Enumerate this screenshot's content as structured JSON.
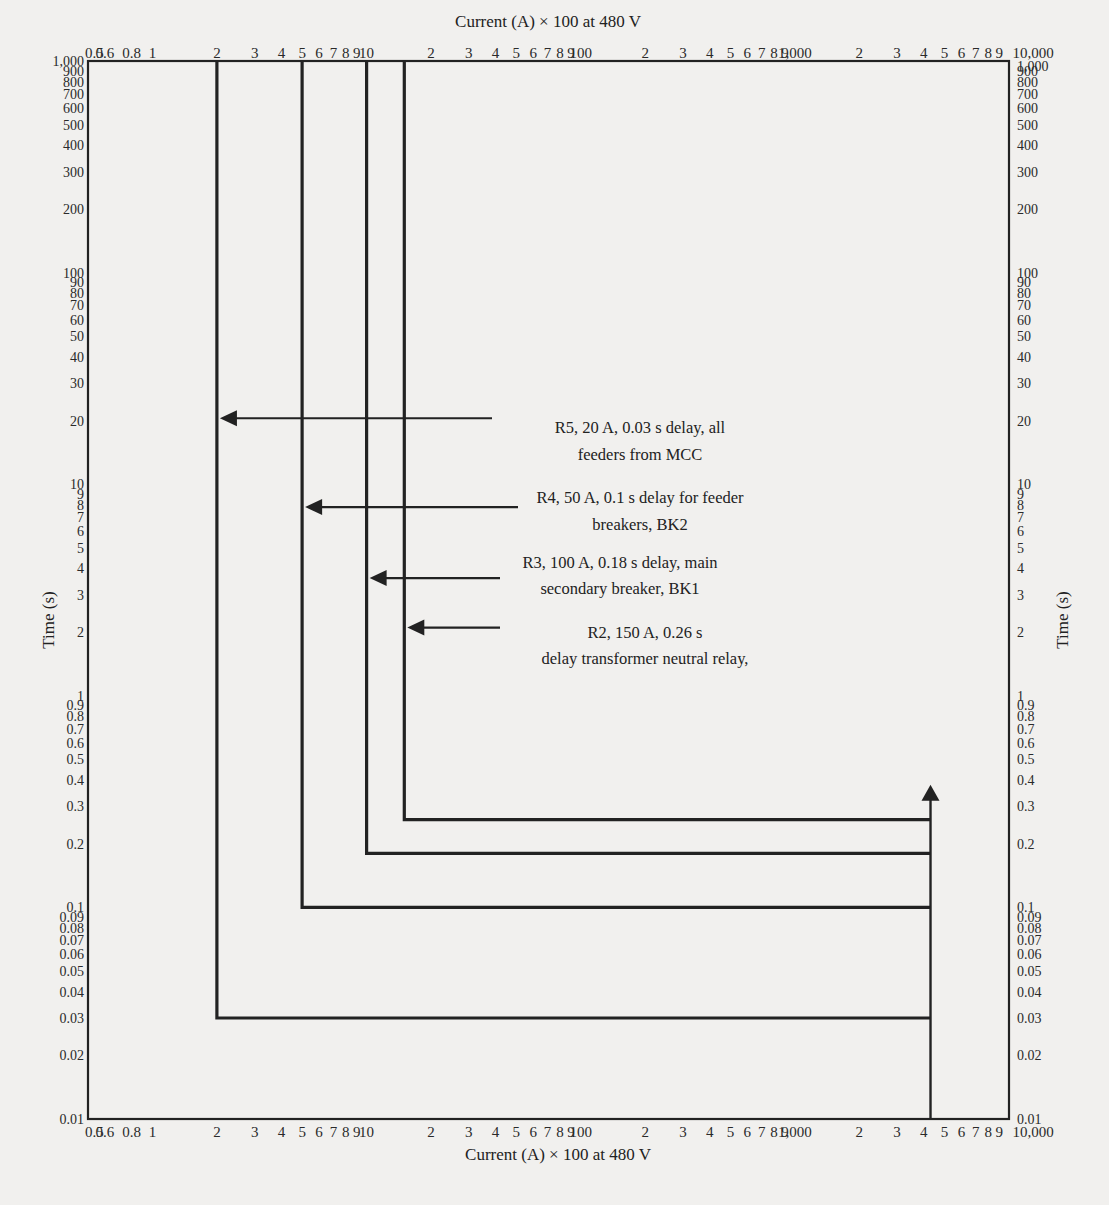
{
  "chart_data": {
    "type": "line",
    "title": "",
    "xlabel": "Current (A) × 100 at 480 V",
    "ylabel": "Time (s)",
    "xscale": "log",
    "yscale": "log",
    "xlim": [
      0.5,
      10000
    ],
    "ylim": [
      0.01,
      1000
    ],
    "grid": false,
    "x_tick_labels": [
      {
        "v": 0.5,
        "t": "0.5"
      },
      {
        "v": 0.6,
        "t": "0.6"
      },
      {
        "v": 0.8,
        "t": "0.8"
      },
      {
        "v": 1,
        "t": "1"
      },
      {
        "v": 2,
        "t": "2"
      },
      {
        "v": 3,
        "t": "3"
      },
      {
        "v": 4,
        "t": "4"
      },
      {
        "v": 5,
        "t": "5"
      },
      {
        "v": 6,
        "t": "6"
      },
      {
        "v": 7,
        "t": "7"
      },
      {
        "v": 8,
        "t": "8"
      },
      {
        "v": 9,
        "t": "9"
      },
      {
        "v": 10,
        "t": "10"
      },
      {
        "v": 20,
        "t": "2"
      },
      {
        "v": 30,
        "t": "3"
      },
      {
        "v": 40,
        "t": "4"
      },
      {
        "v": 50,
        "t": "5"
      },
      {
        "v": 60,
        "t": "6"
      },
      {
        "v": 70,
        "t": "7"
      },
      {
        "v": 80,
        "t": "8"
      },
      {
        "v": 90,
        "t": "9"
      },
      {
        "v": 100,
        "t": "100"
      },
      {
        "v": 200,
        "t": "2"
      },
      {
        "v": 300,
        "t": "3"
      },
      {
        "v": 400,
        "t": "4"
      },
      {
        "v": 500,
        "t": "5"
      },
      {
        "v": 600,
        "t": "6"
      },
      {
        "v": 700,
        "t": "7"
      },
      {
        "v": 800,
        "t": "8"
      },
      {
        "v": 900,
        "t": "9"
      },
      {
        "v": 1000,
        "t": "1,000"
      },
      {
        "v": 2000,
        "t": "2"
      },
      {
        "v": 3000,
        "t": "3"
      },
      {
        "v": 4000,
        "t": "4"
      },
      {
        "v": 5000,
        "t": "5"
      },
      {
        "v": 6000,
        "t": "6"
      },
      {
        "v": 7000,
        "t": "7"
      },
      {
        "v": 8000,
        "t": "8"
      },
      {
        "v": 9000,
        "t": "9"
      },
      {
        "v": 10000,
        "t": "10,000"
      }
    ],
    "y_tick_labels": [
      {
        "v": 1000,
        "t": "1,000"
      },
      {
        "v": 900,
        "t": "900"
      },
      {
        "v": 800,
        "t": "800"
      },
      {
        "v": 700,
        "t": "700"
      },
      {
        "v": 600,
        "t": "600"
      },
      {
        "v": 500,
        "t": "500"
      },
      {
        "v": 400,
        "t": "400"
      },
      {
        "v": 300,
        "t": "300"
      },
      {
        "v": 200,
        "t": "200"
      },
      {
        "v": 100,
        "t": "100"
      },
      {
        "v": 90,
        "t": "90"
      },
      {
        "v": 80,
        "t": "80"
      },
      {
        "v": 70,
        "t": "70"
      },
      {
        "v": 60,
        "t": "60"
      },
      {
        "v": 50,
        "t": "50"
      },
      {
        "v": 40,
        "t": "40"
      },
      {
        "v": 30,
        "t": "30"
      },
      {
        "v": 20,
        "t": "20"
      },
      {
        "v": 10,
        "t": "10"
      },
      {
        "v": 9,
        "t": "9"
      },
      {
        "v": 8,
        "t": "8"
      },
      {
        "v": 7,
        "t": "7"
      },
      {
        "v": 6,
        "t": "6"
      },
      {
        "v": 5,
        "t": "5"
      },
      {
        "v": 4,
        "t": "4"
      },
      {
        "v": 3,
        "t": "3"
      },
      {
        "v": 2,
        "t": "2"
      },
      {
        "v": 1,
        "t": "1"
      },
      {
        "v": 0.9,
        "t": "0.9"
      },
      {
        "v": 0.8,
        "t": "0.8"
      },
      {
        "v": 0.7,
        "t": "0.7"
      },
      {
        "v": 0.6,
        "t": "0.6"
      },
      {
        "v": 0.5,
        "t": "0.5"
      },
      {
        "v": 0.4,
        "t": "0.4"
      },
      {
        "v": 0.3,
        "t": "0.3"
      },
      {
        "v": 0.2,
        "t": "0.2"
      },
      {
        "v": 0.1,
        "t": "0.1"
      },
      {
        "v": 0.09,
        "t": "0.09"
      },
      {
        "v": 0.08,
        "t": "0.08"
      },
      {
        "v": 0.07,
        "t": "0.07"
      },
      {
        "v": 0.06,
        "t": "0.06"
      },
      {
        "v": 0.05,
        "t": "0.05"
      },
      {
        "v": 0.04,
        "t": "0.04"
      },
      {
        "v": 0.03,
        "t": "0.03"
      },
      {
        "v": 0.02,
        "t": "0.02"
      },
      {
        "v": 0.01,
        "t": "0.01"
      }
    ],
    "series": [
      {
        "name": "R2",
        "pickup_x": 15,
        "delay_s": 0.26,
        "label": "R2, 150 A, 0.26 s delay transformer neutral relay,",
        "points": [
          [
            15,
            1000
          ],
          [
            15,
            0.26
          ],
          [
            4300,
            0.26
          ]
        ]
      },
      {
        "name": "R3",
        "pickup_x": 10,
        "delay_s": 0.18,
        "label": "R3, 100 A, 0.18 s delay, main secondary breaker, BK1",
        "points": [
          [
            10,
            1000
          ],
          [
            10,
            0.18
          ],
          [
            4300,
            0.18
          ]
        ]
      },
      {
        "name": "R4",
        "pickup_x": 5,
        "delay_s": 0.1,
        "label": "R4, 50 A, 0.1 s delay for feeder breakers, BK2",
        "points": [
          [
            5,
            1000
          ],
          [
            5,
            0.1
          ],
          [
            4300,
            0.1
          ]
        ]
      },
      {
        "name": "R5",
        "pickup_x": 2,
        "delay_s": 0.03,
        "label": "R5, 20 A, 0.03 s delay, all feeders from MCC",
        "points": [
          [
            2,
            1000
          ],
          [
            2,
            0.03
          ],
          [
            4300,
            0.03
          ]
        ]
      }
    ],
    "fault_current_arrow": {
      "x": 4300,
      "y_from": 0.01,
      "y_to": 0.38
    },
    "annotations": [
      {
        "id": "R5",
        "lines": [
          "R5, 20 A, 0.03 s delay, all",
          "feeders from MCC"
        ],
        "arrow_y": 20.5,
        "arrow_to_x": 2,
        "arrow_from_px": 492,
        "text_x": 640,
        "text_y": [
          433,
          460
        ]
      },
      {
        "id": "R4",
        "lines": [
          "R4, 50 A, 0.1 s delay for feeder",
          "breakers, BK2"
        ],
        "arrow_y": 7.8,
        "arrow_to_x": 5,
        "arrow_from_px": 518,
        "text_x": 640,
        "text_y": [
          503,
          530
        ]
      },
      {
        "id": "R3",
        "lines": [
          "R3, 100 A, 0.18 s delay, main",
          "secondary breaker, BK1"
        ],
        "arrow_y": 3.6,
        "arrow_to_x": 10,
        "arrow_from_px": 500,
        "text_x": 620,
        "text_y": [
          568,
          594
        ]
      },
      {
        "id": "R2",
        "lines": [
          "R2, 150 A, 0.26 s",
          "delay transformer neutral relay,"
        ],
        "arrow_y": 2.1,
        "arrow_to_x": 15,
        "arrow_from_px": 500,
        "text_x": 645,
        "text_y": [
          638,
          664
        ]
      }
    ]
  },
  "labels": {
    "top_axis_title": "Current (A) × 100 at 480 V",
    "bottom_axis_title": "Current (A) × 100 at 480 V",
    "left_axis_title": "Time (s)",
    "right_axis_title": "Time (s)"
  },
  "colors": {
    "background": "#f1f0ee",
    "ink": "#222222"
  }
}
